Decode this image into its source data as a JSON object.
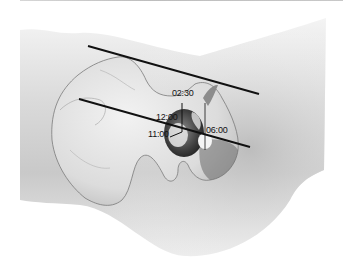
{
  "figure": {
    "labels": {
      "l0230": "02:30",
      "l1200": "12:00",
      "l1100": "11:00",
      "l0600": "06:00"
    },
    "lines": [
      {
        "name": "upper-reference-line",
        "x1": 88,
        "y1": 46,
        "x2": 259,
        "y2": 94
      },
      {
        "name": "lower-reference-line",
        "x1": 79,
        "y1": 99,
        "x2": 250,
        "y2": 147
      }
    ],
    "colors": {
      "line": "#111111",
      "bone": "#d9d9d9",
      "bone_dark": "#5a5a5a",
      "shadow": "#9e9e9e"
    }
  }
}
